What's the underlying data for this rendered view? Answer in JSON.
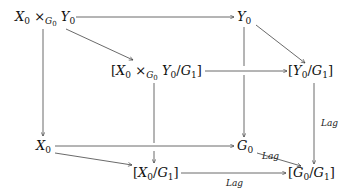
{
  "diagram": {
    "type": "commutative-diagram",
    "nodes": [
      {
        "id": "fiber_product",
        "text": "X₀ ×_{G₀} Y₀",
        "base": "X",
        "sub": "0",
        "op": "×",
        "op_sub": "G₀",
        "base2": "Y",
        "sub2": "0"
      },
      {
        "id": "Y0",
        "text": "Y₀"
      },
      {
        "id": "quotient_fiber_product",
        "text": "[X₀ ×_{G₀} Y₀/G₁]"
      },
      {
        "id": "Y0_quot",
        "text": "[Y₀/G₁]"
      },
      {
        "id": "X0",
        "text": "X₀"
      },
      {
        "id": "G0",
        "text": "G₀"
      },
      {
        "id": "X0_quot",
        "text": "[X₀/G₁]"
      },
      {
        "id": "G0_quot",
        "text": "[G₀/G₁]"
      }
    ],
    "edges": [
      {
        "from": "fiber_product",
        "to": "Y0",
        "label": ""
      },
      {
        "from": "fiber_product",
        "to": "quotient_fiber_product",
        "label": ""
      },
      {
        "from": "fiber_product",
        "to": "X0",
        "label": ""
      },
      {
        "from": "Y0",
        "to": "Y0_quot",
        "label": ""
      },
      {
        "from": "Y0",
        "to": "G0",
        "label": ""
      },
      {
        "from": "quotient_fiber_product",
        "to": "Y0_quot",
        "label": ""
      },
      {
        "from": "quotient_fiber_product",
        "to": "X0_quot",
        "label": ""
      },
      {
        "from": "Y0_quot",
        "to": "G0_quot",
        "label": "Lag"
      },
      {
        "from": "X0",
        "to": "G0",
        "label": ""
      },
      {
        "from": "X0",
        "to": "X0_quot",
        "label": ""
      },
      {
        "from": "G0",
        "to": "G0_quot",
        "label": "Lag"
      },
      {
        "from": "X0_quot",
        "to": "G0_quot",
        "label": "Lag"
      }
    ],
    "labels": {
      "lag_right": "Lag",
      "lag_diag": "Lag",
      "lag_bottom": "Lag"
    },
    "symbols": {
      "X": "X",
      "Y": "Y",
      "G": "G",
      "zero": "0",
      "one": "1",
      "times": "×",
      "slash": "/",
      "lbrack": "[",
      "rbrack": "]"
    }
  }
}
